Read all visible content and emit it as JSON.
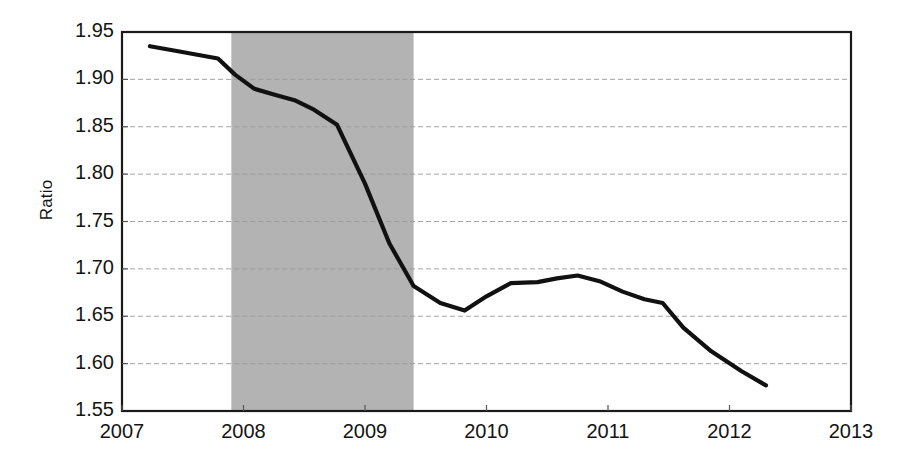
{
  "chart_data": {
    "type": "line",
    "title": "",
    "xlabel": "",
    "ylabel": "Ratio",
    "xlim": [
      2007,
      2013
    ],
    "ylim": [
      1.55,
      1.95
    ],
    "grid": true,
    "legend": "none",
    "x_ticks": [
      "2007",
      "2008",
      "2009",
      "2010",
      "2011",
      "2012",
      "2013"
    ],
    "x_tick_values": [
      2007,
      2008,
      2009,
      2010,
      2011,
      2012,
      2013
    ],
    "y_ticks": [
      "1.55",
      "1.60",
      "1.65",
      "1.70",
      "1.75",
      "1.80",
      "1.85",
      "1.90",
      "1.95"
    ],
    "y_tick_values": [
      1.55,
      1.6,
      1.65,
      1.7,
      1.75,
      1.8,
      1.85,
      1.9,
      1.95
    ],
    "line_color": "#111111",
    "shaded_region_color": "#b3b3b3",
    "shaded_regions": [
      {
        "label": "recession",
        "x_start": 2007.9,
        "x_end": 2009.4
      }
    ],
    "series": [
      {
        "name": "Ratio",
        "x": [
          2007.23,
          2007.45,
          2007.62,
          2007.79,
          2007.93,
          2008.09,
          2008.25,
          2008.42,
          2008.58,
          2008.77,
          2009.0,
          2009.2,
          2009.4,
          2009.62,
          2009.82,
          2010.0,
          2010.2,
          2010.42,
          2010.58,
          2010.75,
          2010.93,
          2011.12,
          2011.3,
          2011.45,
          2011.62,
          2011.85,
          2012.1,
          2012.3
        ],
        "y": [
          1.935,
          1.93,
          1.926,
          1.922,
          1.905,
          1.89,
          1.884,
          1.878,
          1.868,
          1.852,
          1.79,
          1.727,
          1.682,
          1.664,
          1.656,
          1.671,
          1.685,
          1.686,
          1.69,
          1.693,
          1.687,
          1.676,
          1.668,
          1.664,
          1.638,
          1.613,
          1.592,
          1.577
        ]
      }
    ]
  },
  "axes": {
    "y_axis_title": "Ratio"
  }
}
